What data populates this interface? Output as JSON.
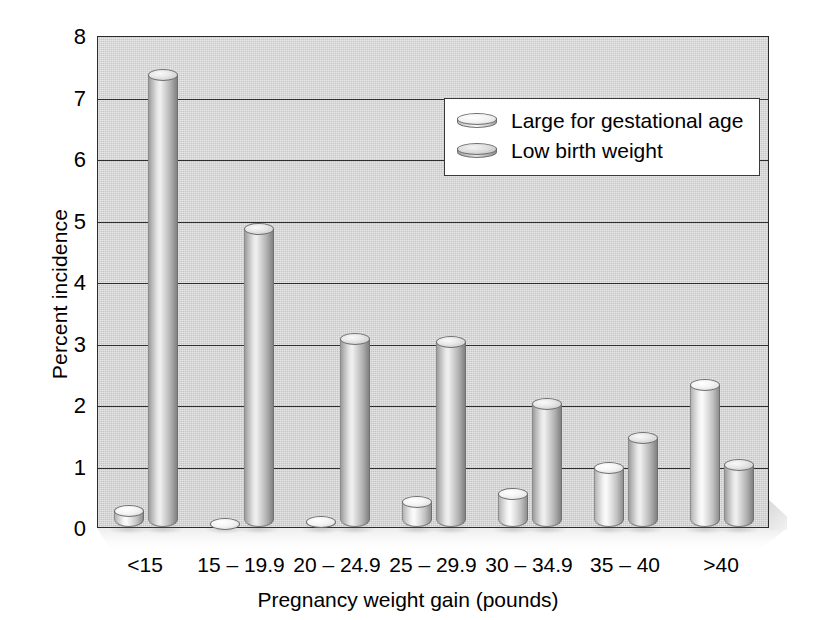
{
  "chart_data": {
    "type": "bar",
    "title": "",
    "xlabel": "Pregnancy weight gain (pounds)",
    "ylabel": "Percent incidence",
    "categories": [
      "<15",
      "15 – 19.9",
      "20 – 24.9",
      "25 – 29.9",
      "30 – 34.9",
      "35 – 40",
      ">40"
    ],
    "series": [
      {
        "name": "Large for gestational age",
        "values": [
          0.35,
          0.13,
          0.18,
          0.5,
          0.63,
          1.05,
          2.4
        ]
      },
      {
        "name": "Low birth weight",
        "values": [
          7.45,
          4.95,
          3.15,
          3.1,
          2.1,
          1.55,
          1.1
        ]
      }
    ],
    "ylim": [
      0,
      8
    ],
    "yticks": [
      "0",
      "1",
      "2",
      "3",
      "4",
      "5",
      "6",
      "7",
      "8"
    ],
    "grid": "horizontal",
    "legend_position": "upper right",
    "style": "3d-cylinder-bars",
    "colors": {
      "plot_background": "#c7c7c7",
      "axis": "#2b2b2b",
      "gridline": "#2f2f2f",
      "bar_large_for_gestational_age": "#e6e6e6",
      "bar_low_birth_weight": "#c9c9c9",
      "legend_background": "#ffffff",
      "text": "#000000"
    }
  },
  "legend": {
    "items": [
      {
        "label": "Large for gestational age",
        "swatch": "cylinder-disc-light"
      },
      {
        "label": "Low birth weight",
        "swatch": "cylinder-disc-dark"
      }
    ]
  }
}
